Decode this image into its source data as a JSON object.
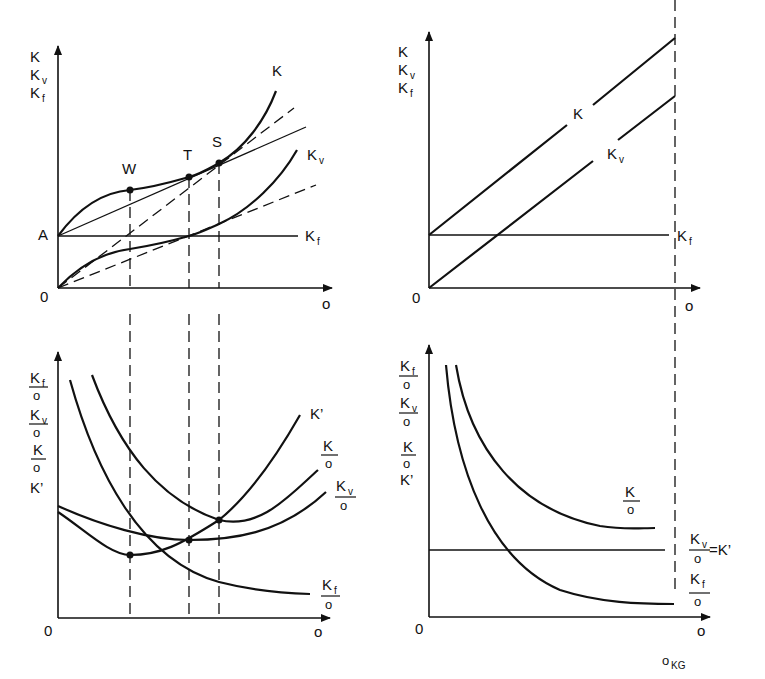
{
  "panels": {
    "top_left": {
      "y_axis_labels": [
        "K",
        "Kv",
        "Kf"
      ],
      "origin": "0",
      "x_axis": "o",
      "a_label": "A",
      "points": [
        "W",
        "T",
        "S"
      ],
      "curves": {
        "k": "K",
        "kv": "Kv",
        "kf": "Kf"
      }
    },
    "top_right": {
      "y_axis_labels": [
        "K",
        "Kv",
        "Kf"
      ],
      "origin": "0",
      "x_axis": "o",
      "curves": {
        "k": "K",
        "kv": "Kv",
        "kf": "Kf"
      }
    },
    "bottom_left": {
      "y_axis_labels": [
        "Kf/o",
        "Kv/o",
        "K/o",
        "K'"
      ],
      "origin": "0",
      "x_axis": "o",
      "curves": {
        "kprime": "K'",
        "k_o": "K/o",
        "kv_o": "Kv/o",
        "kf_o": "Kf/o"
      }
    },
    "bottom_right": {
      "y_axis_labels": [
        "Kf/o",
        "Kv/o",
        "K/o",
        "K'"
      ],
      "origin": "0",
      "x_axis": "o",
      "capacity_label": "oKG",
      "curves": {
        "k_o": "K/o",
        "kv_o_eq": "Kv/o = K'",
        "kf_o": "Kf/o"
      }
    }
  },
  "text": {
    "K": "K",
    "o": "o",
    "zero": "0",
    "A": "A",
    "W": "W",
    "T": "T",
    "S": "S",
    "v": "v",
    "f": "f",
    "Kprime": "K’",
    "eqKprime": "=K’",
    "KG": "KG"
  }
}
